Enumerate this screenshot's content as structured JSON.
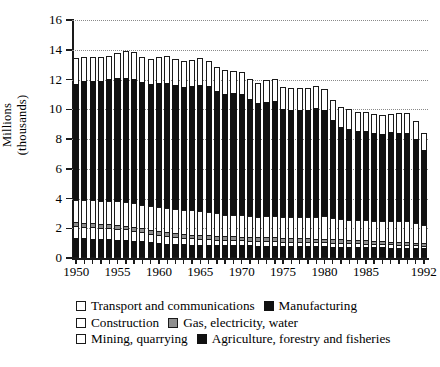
{
  "chart_data": {
    "type": "bar",
    "stacked": true,
    "title": "",
    "xlabel": "",
    "ylabel": "Millions (thousands)",
    "ylabel_lines": [
      "Millions",
      "(thousands)"
    ],
    "ylim": [
      0,
      16
    ],
    "ytick_values": [
      0,
      2,
      4,
      6,
      8,
      10,
      12,
      14,
      16
    ],
    "ytick_labels": [
      "0",
      "2",
      "4",
      "6",
      "8",
      "10",
      "12",
      "14",
      "16"
    ],
    "grid": "horizontal-dotted",
    "legend_position": "below",
    "x": [
      1950,
      1951,
      1952,
      1953,
      1954,
      1955,
      1956,
      1957,
      1958,
      1959,
      1960,
      1961,
      1962,
      1963,
      1964,
      1965,
      1966,
      1967,
      1968,
      1969,
      1970,
      1971,
      1972,
      1973,
      1974,
      1975,
      1976,
      1977,
      1978,
      1979,
      1980,
      1981,
      1982,
      1983,
      1984,
      1985,
      1986,
      1987,
      1988,
      1989,
      1990,
      1991,
      1992
    ],
    "xtick_labels": [
      "1950",
      "1955",
      "1960",
      "1965",
      "1970",
      "1975",
      "1980",
      "1985",
      "1992"
    ],
    "xtick_years": [
      1950,
      1955,
      1960,
      1965,
      1970,
      1975,
      1980,
      1985,
      1992
    ],
    "series": [
      {
        "name": "Agriculture, forestry and fisheries",
        "color": "#111111",
        "swatch": "black",
        "values": [
          1.35,
          1.32,
          1.3,
          1.28,
          1.26,
          1.24,
          1.22,
          1.16,
          1.12,
          1.06,
          1.0,
          0.96,
          0.94,
          0.92,
          0.9,
          0.88,
          0.88,
          0.87,
          0.86,
          0.86,
          0.86,
          0.85,
          0.84,
          0.84,
          0.83,
          0.82,
          0.82,
          0.81,
          0.8,
          0.79,
          0.78,
          0.77,
          0.76,
          0.75,
          0.74,
          0.73,
          0.72,
          0.71,
          0.7,
          0.69,
          0.68,
          0.67,
          0.64
        ]
      },
      {
        "name": "Mining, quarrying",
        "color": "#ffffff",
        "swatch": "white",
        "values": [
          0.8,
          0.78,
          0.77,
          0.76,
          0.74,
          0.72,
          0.7,
          0.66,
          0.62,
          0.57,
          0.53,
          0.5,
          0.47,
          0.45,
          0.43,
          0.41,
          0.39,
          0.37,
          0.35,
          0.34,
          0.33,
          0.32,
          0.31,
          0.3,
          0.3,
          0.29,
          0.29,
          0.29,
          0.28,
          0.28,
          0.28,
          0.27,
          0.27,
          0.26,
          0.25,
          0.24,
          0.23,
          0.22,
          0.21,
          0.2,
          0.19,
          0.18,
          0.17
        ]
      },
      {
        "name": "Gas, electricity, water",
        "color": "#8f8f8f",
        "swatch": "gray",
        "values": [
          0.26,
          0.26,
          0.26,
          0.26,
          0.26,
          0.26,
          0.26,
          0.26,
          0.26,
          0.26,
          0.26,
          0.26,
          0.25,
          0.25,
          0.25,
          0.25,
          0.25,
          0.25,
          0.25,
          0.25,
          0.25,
          0.25,
          0.25,
          0.25,
          0.25,
          0.24,
          0.24,
          0.24,
          0.24,
          0.24,
          0.24,
          0.23,
          0.23,
          0.22,
          0.22,
          0.21,
          0.21,
          0.2,
          0.2,
          0.19,
          0.19,
          0.18,
          0.18
        ]
      },
      {
        "name": "Construction",
        "color": "#ffffff",
        "swatch": "white",
        "values": [
          1.48,
          1.52,
          1.54,
          1.56,
          1.58,
          1.6,
          1.62,
          1.6,
          1.58,
          1.6,
          1.62,
          1.64,
          1.62,
          1.6,
          1.62,
          1.62,
          1.58,
          1.52,
          1.46,
          1.44,
          1.42,
          1.4,
          1.38,
          1.42,
          1.44,
          1.4,
          1.38,
          1.4,
          1.42,
          1.46,
          1.5,
          1.44,
          1.38,
          1.36,
          1.36,
          1.36,
          1.36,
          1.36,
          1.38,
          1.4,
          1.42,
          1.34,
          1.2
        ]
      },
      {
        "name": "Manufacturing",
        "color": "#111111",
        "swatch": "black",
        "values": [
          7.8,
          8.0,
          8.02,
          8.04,
          8.18,
          8.26,
          8.3,
          8.34,
          8.26,
          8.22,
          8.34,
          8.38,
          8.34,
          8.3,
          8.36,
          8.46,
          8.46,
          8.22,
          8.12,
          8.18,
          8.18,
          7.84,
          7.62,
          7.7,
          7.72,
          7.24,
          7.22,
          7.24,
          7.22,
          7.3,
          7.12,
          6.54,
          6.18,
          6.1,
          6.0,
          5.98,
          5.9,
          5.86,
          5.96,
          5.96,
          5.96,
          5.62,
          5.08
        ]
      },
      {
        "name": "Transport and communications",
        "color": "#ffffff",
        "swatch": "white",
        "values": [
          1.76,
          1.62,
          1.6,
          1.6,
          1.58,
          1.72,
          1.8,
          1.82,
          1.68,
          1.7,
          1.78,
          1.82,
          1.74,
          1.7,
          1.74,
          1.82,
          1.72,
          1.64,
          1.58,
          1.5,
          1.46,
          1.4,
          1.4,
          1.46,
          1.48,
          1.48,
          1.46,
          1.46,
          1.44,
          1.48,
          1.42,
          1.36,
          1.32,
          1.3,
          1.28,
          1.28,
          1.26,
          1.24,
          1.26,
          1.3,
          1.3,
          1.24,
          1.16
        ]
      }
    ],
    "legend_rows": [
      [
        {
          "label": "Transport and communications",
          "swatch": "white"
        },
        {
          "label": "Manufacturing",
          "swatch": "black"
        }
      ],
      [
        {
          "label": "Construction",
          "swatch": "white"
        },
        {
          "label": "Gas, electricity, water",
          "swatch": "gray"
        }
      ],
      [
        {
          "label": "Mining, quarrying",
          "swatch": "white"
        },
        {
          "label": "Agriculture, forestry and fisheries",
          "swatch": "black"
        }
      ]
    ]
  }
}
